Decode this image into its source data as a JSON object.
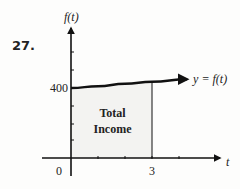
{
  "problem_number": "27.",
  "chart_data": {
    "type": "area",
    "title": "",
    "xlabel": "t",
    "ylabel": "f(t)",
    "x_ticks": [
      1,
      2,
      3,
      4
    ],
    "x_tick_labels": [
      {
        "value": 0,
        "label": "0"
      },
      {
        "value": 3,
        "label": "3"
      }
    ],
    "y_tick_labels": [
      {
        "value": 400,
        "label": "400"
      }
    ],
    "series": [
      {
        "name": "y = f(t)",
        "x": [
          0,
          1,
          2,
          3,
          4.3
        ],
        "y": [
          400,
          410,
          424,
          436,
          450
        ]
      }
    ],
    "shaded_region": {
      "from": 0,
      "to": 3,
      "label_lines": [
        "Total",
        "Income"
      ]
    },
    "curve_label": "y = f(t)",
    "xlim": [
      -1.05,
      5.5
    ],
    "ylim": [
      0,
      700
    ],
    "grid": false,
    "legend": "none"
  }
}
